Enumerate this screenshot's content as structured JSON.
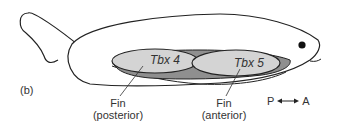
{
  "figure": {
    "panel_label": "(b)",
    "colors": {
      "outline": "#222222",
      "body_fill": "#ffffff",
      "fin_domain_fill": "#d4d4d4",
      "connecting_band_fill": "#8f8f8f",
      "eye": "#111111"
    },
    "domains": [
      {
        "gene": "Tbx 4",
        "label_line1": "Fin",
        "label_line2": "(posterior)"
      },
      {
        "gene": "Tbx 5",
        "label_line1": "Fin",
        "label_line2": "(anterior)"
      }
    ],
    "axis": {
      "left": "P",
      "right": "A",
      "arrow": "double-headed"
    }
  }
}
